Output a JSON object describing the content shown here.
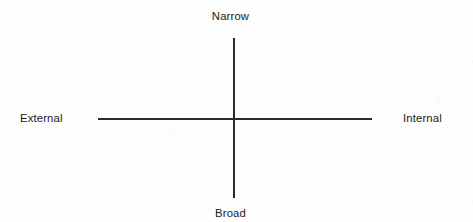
{
  "diagram": {
    "type": "two-axis-matrix",
    "background_color": "#fdfdfc",
    "line_color": "#2b2b2b",
    "text_color": "#1b1b1b",
    "axes": {
      "vertical": {
        "top_label": "Narrow",
        "bottom_label": "Broad"
      },
      "horizontal": {
        "left_label": "External",
        "right_label": "Internal"
      }
    },
    "labels": {
      "top": "Narrow",
      "bottom": "Broad",
      "left": "External",
      "right": "Internal"
    }
  },
  "chart_data": {
    "type": "scatter",
    "title": "",
    "subtitle": "",
    "xlabel": "",
    "ylabel": "",
    "x_axis_left_label": "External",
    "x_axis_right_label": "Internal",
    "y_axis_top_label": "Narrow",
    "y_axis_bottom_label": "Broad",
    "xlim": [
      -1,
      1
    ],
    "ylim": [
      -1,
      1
    ],
    "grid": false,
    "legend": "none",
    "series": [],
    "annotations": [
      {
        "text": "Narrow",
        "position": "top"
      },
      {
        "text": "Broad",
        "position": "bottom"
      },
      {
        "text": "External",
        "position": "left"
      },
      {
        "text": "Internal",
        "position": "right"
      }
    ]
  }
}
